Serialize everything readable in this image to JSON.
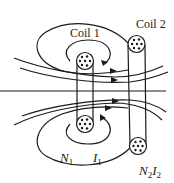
{
  "diagram": {
    "labels": {
      "coil1": "Coil 1",
      "coil2": "Coil 2",
      "n1": "N",
      "n1_sub": "1",
      "i1": "I",
      "i1_sub": "1",
      "n2": "N",
      "n2_sub": "2",
      "i2": "I",
      "i2_sub": "2"
    },
    "colors": {
      "line": "#1a1a1a",
      "background": "#ffffff"
    }
  }
}
